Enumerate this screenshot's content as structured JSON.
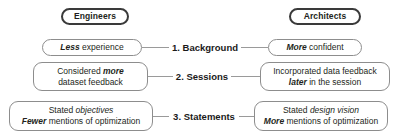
{
  "diagram": {
    "type": "two-column-comparison",
    "columns": [
      {
        "id": "engineers",
        "header": "Engineers"
      },
      {
        "id": "architects",
        "header": "Architects"
      }
    ],
    "rows": [
      {
        "stage_label": "1. Background",
        "left": {
          "lines": [
            "Less experience"
          ],
          "emphasis": [
            "Less"
          ]
        },
        "right": {
          "lines": [
            "More confident"
          ],
          "emphasis": [
            "More"
          ]
        }
      },
      {
        "stage_label": "2. Sessions",
        "left": {
          "lines": [
            "Considered more",
            "dataset feedback"
          ],
          "emphasis": [
            "more"
          ]
        },
        "right": {
          "lines": [
            "Incorporated data feedback",
            "later in the session"
          ],
          "emphasis": [
            "later"
          ]
        }
      },
      {
        "stage_label": "3. Statements",
        "left": {
          "lines": [
            "Stated objectives",
            "Fewer mentions of optimization"
          ],
          "emphasis": [
            "objectives",
            "Fewer"
          ]
        },
        "right": {
          "lines": [
            "Stated design vision",
            "More mentions of optimization"
          ],
          "emphasis": [
            "design vision",
            "More"
          ]
        }
      }
    ],
    "text": {
      "engineers_header": "Engineers",
      "architects_header": "Architects",
      "stage1": "1. Background",
      "stage2": "2. Sessions",
      "stage3": "3. Statements",
      "r1_left_em": "Less",
      "r1_left_rest": " experience",
      "r1_right_em": "More",
      "r1_right_rest": " confident",
      "r2_left_l1_pre": "Considered ",
      "r2_left_l1_em": "more",
      "r2_left_l2": "dataset feedback",
      "r2_right_l1": "Incorporated data feedback",
      "r2_right_l2_em": "later",
      "r2_right_l2_rest": " in the session",
      "r3_left_l1_pre": "Stated ",
      "r3_left_l1_em": "objectives",
      "r3_left_l2_em": "Fewer",
      "r3_left_l2_rest": " mentions of optimization",
      "r3_right_l1_pre": "Stated ",
      "r3_right_l1_em": "design vision",
      "r3_right_l2_em": "More",
      "r3_right_l2_rest": " mentions of optimization"
    },
    "colors": {
      "background": "#ffffff",
      "box_border": "#8d8d8d",
      "header_border": "#3a3a3a",
      "connector": "#9a9a9a",
      "text": "#231f20"
    }
  }
}
